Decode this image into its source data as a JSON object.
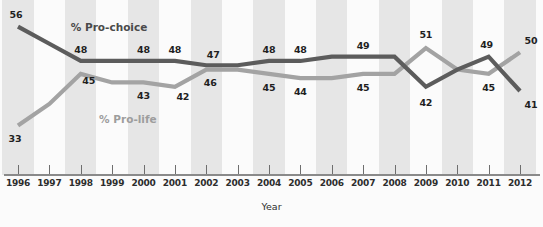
{
  "chart_data": {
    "type": "line",
    "title": "",
    "xlabel": "Year",
    "ylabel": "",
    "grid": false,
    "legend_position": "inline-annotation",
    "xlim": [
      1996,
      2012
    ],
    "ylim": [
      31,
      58
    ],
    "x": [
      1996,
      1997,
      1998,
      1999,
      2000,
      2001,
      2002,
      2003,
      2004,
      2005,
      2006,
      2007,
      2008,
      2009,
      2010,
      2011,
      2012
    ],
    "categories": [
      "1996",
      "1997",
      "1998",
      "1999",
      "2000",
      "2001",
      "2002",
      "2003",
      "2004",
      "2005",
      "2006",
      "2007",
      "2008",
      "2009",
      "2010",
      "2011",
      "2012"
    ],
    "series": [
      {
        "name": "% Pro-choice",
        "color": "#5c5c5c",
        "values": [
          56,
          52,
          48,
          48,
          48,
          48,
          47,
          47,
          48,
          48,
          49,
          49,
          49,
          42,
          46,
          49,
          41
        ],
        "labels": [
          {
            "x": 1996,
            "value": 56,
            "text": "56"
          },
          {
            "x": 1998,
            "value": 48,
            "text": "48"
          },
          {
            "x": 2000,
            "value": 48,
            "text": "48"
          },
          {
            "x": 2001,
            "value": 48,
            "text": "48"
          },
          {
            "x": 2002,
            "value": 47,
            "text": "47"
          },
          {
            "x": 2004,
            "value": 48,
            "text": "48"
          },
          {
            "x": 2005,
            "value": 48,
            "text": "48"
          },
          {
            "x": 2007,
            "value": 49,
            "text": "49"
          },
          {
            "x": 2009,
            "value": 42,
            "text": "42"
          },
          {
            "x": 2011,
            "value": 49,
            "text": "49"
          },
          {
            "x": 2012,
            "value": 41,
            "text": "41"
          }
        ]
      },
      {
        "name": "% Pro-life",
        "color": "#a3a3a3",
        "values": [
          33,
          38,
          45,
          43,
          43,
          42,
          46,
          46,
          45,
          44,
          44,
          45,
          45,
          51,
          46,
          45,
          50
        ],
        "labels": [
          {
            "x": 1996,
            "value": 33,
            "text": "33"
          },
          {
            "x": 1998,
            "value": 45,
            "text": "45"
          },
          {
            "x": 2000,
            "value": 43,
            "text": "43"
          },
          {
            "x": 2001,
            "value": 42,
            "text": "42"
          },
          {
            "x": 2002,
            "value": 46,
            "text": "46"
          },
          {
            "x": 2004,
            "value": 45,
            "text": "45"
          },
          {
            "x": 2005,
            "value": 44,
            "text": "44"
          },
          {
            "x": 2007,
            "value": 45,
            "text": "45"
          },
          {
            "x": 2009,
            "value": 51,
            "text": "51"
          },
          {
            "x": 2011,
            "value": 45,
            "text": "45"
          },
          {
            "x": 2012,
            "value": 50,
            "text": "50"
          }
        ]
      }
    ],
    "annotations": [
      {
        "name": "prochoice-series-label",
        "text": "% Pro-choice",
        "x": 1997.5,
        "value": 56.0,
        "series": "prochoice"
      },
      {
        "name": "prolife-series-label",
        "text": "% Pro-life",
        "x": 1998.1,
        "value": 34.4,
        "series": "prolife"
      }
    ]
  },
  "background": {
    "band_color": "#e6e6e6",
    "plot_color": "#fbfbfb",
    "axis_color": "#8a8a8a"
  }
}
